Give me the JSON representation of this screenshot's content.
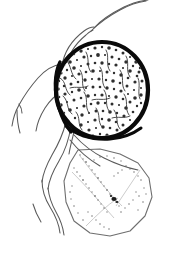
{
  "figure": {
    "description": "Ink line illustration of a thick-walled spherical spore body with granular contents, attached below to a thin-walled teardrop-shaped sac with sparse internal stippling, with slender branching hyphal filaments extending to the upper left, upper right and lower left.",
    "medium": "pen-and-ink scientific illustration",
    "background_color": "#ffffff",
    "width": 170,
    "height": 257
  },
  "palette": {
    "ink_black": "#111111",
    "wall_black": "#0a0a0a",
    "hypha_gray": "#5a5a5a",
    "sac_outline_gray": "#6e6e6e",
    "stipple_gray": "#8a8a8a",
    "granule_dark": "#2b2b2b",
    "paper_white": "#ffffff"
  },
  "structures": {
    "spore_body": {
      "name": "spherical spore body",
      "label": "thick-walled spore",
      "center_x": 102,
      "center_y": 90,
      "radius_x": 48,
      "radius_y": 50,
      "wall_thickness_px": 4,
      "wall_color": "#0a0a0a",
      "fill_texture": "granular-reticulate",
      "fill_color": "#ffffff",
      "granule_count": 430
    },
    "sac": {
      "name": "teardrop sac",
      "label": "thin-walled vesicle",
      "outline_color": "#6e6e6e",
      "outline_width_px": 1.1,
      "fill_color": "#ffffff",
      "apex_x": 78,
      "apex_y": 150,
      "bottom_y": 236,
      "left_x": 64,
      "right_x": 152,
      "stipple_count": 180
    },
    "hyphae": {
      "name": "hyphal filaments",
      "label": "branching filaments",
      "stroke_color": "#5a5a5a",
      "stroke_width_px": 1.1,
      "strand_count": 9
    }
  },
  "annotations": {
    "visible_text": "",
    "scale_bar": "",
    "figure_number": ""
  }
}
